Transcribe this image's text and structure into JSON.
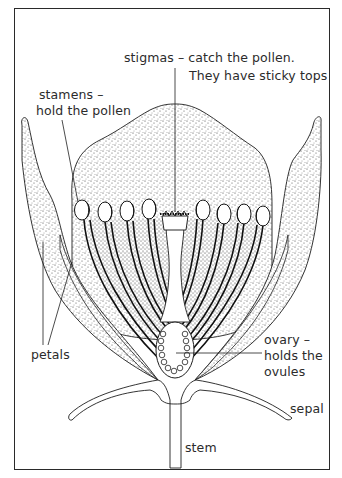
{
  "diagram": {
    "type": "labelled-biology-diagram",
    "colors": {
      "line": "#1e1e1e",
      "stipple": "#3a3a3a",
      "background": "#ffffff",
      "text": "#2b2b2b"
    }
  },
  "labels": {
    "stigmas": {
      "line1": "stigmas  –  catch the pollen.",
      "line2": "They have sticky tops"
    },
    "stamens": {
      "line1": "stamens  –",
      "line2": "hold the pollen"
    },
    "petals": {
      "text": "petals"
    },
    "ovary": {
      "line1": "ovary  –",
      "line2": "holds the",
      "line3": "ovules"
    },
    "sepal": {
      "text": "sepal"
    },
    "stem": {
      "text": "stem"
    }
  },
  "parts": {
    "stamen_count_left": 4,
    "stamen_count_right": 4,
    "petal_count": 2,
    "sepal_count": 2
  }
}
